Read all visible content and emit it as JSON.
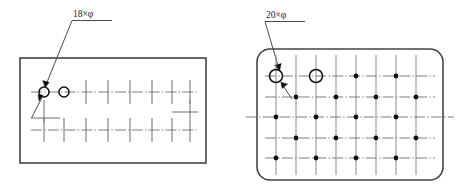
{
  "figure": {
    "background_color": "#ffffff",
    "line_color": "#6f6f6f",
    "outline_color": "#444444",
    "marker_color": "#111111"
  },
  "left_plate": {
    "name": "left-plate",
    "shape": "rectangle",
    "corner_style": "square",
    "label": {
      "text": "18×φ",
      "count": "18",
      "multiplier_symbol": "×",
      "diameter_symbol": "φ",
      "underlined": true
    },
    "outline": {
      "x": 20,
      "y": 58,
      "width": 186,
      "height": 105
    },
    "rows": [
      {
        "row": 1,
        "y": 92,
        "marker_type": "circle",
        "circle_columns": [
          1,
          2
        ],
        "tick_columns": [
          3,
          4,
          5,
          6,
          7,
          8
        ]
      },
      {
        "row": 2,
        "y": 130,
        "marker_type": "tick",
        "circle_columns": [],
        "tick_columns": [
          1,
          2,
          3,
          4,
          5,
          6,
          7,
          8
        ]
      }
    ],
    "short_row": {
      "row": 3,
      "y": 112,
      "x_start": 172,
      "x_end": 198
    },
    "circle_radius": 5.0,
    "hole_total": 18
  },
  "right_plate": {
    "name": "right-plate",
    "shape": "rounded-rectangle",
    "corner_style": "rounded",
    "corner_radius": 13,
    "label": {
      "text": "20×φ",
      "count": "20",
      "multiplier_symbol": "×",
      "diameter_symbol": "φ",
      "underlined": true
    },
    "outline": {
      "x": 257,
      "y": 49,
      "width": 186,
      "height": 131
    },
    "columns_x": [
      276,
      296,
      316,
      336,
      356,
      376,
      396,
      416
    ],
    "rows_y": [
      76,
      97,
      117,
      138,
      158
    ],
    "row_markers": [
      {
        "row": 1,
        "y": 76,
        "circles": [
          1,
          3
        ],
        "dots": [
          5,
          7
        ]
      },
      {
        "row": 2,
        "y": 97,
        "circles": [],
        "dots": [
          2,
          4,
          6,
          8
        ]
      },
      {
        "row": 3,
        "y": 117,
        "circles": [],
        "dots": [
          1,
          3,
          5,
          7
        ],
        "is_main_centerline": true
      },
      {
        "row": 4,
        "y": 138,
        "circles": [],
        "dots": [
          2,
          4,
          6,
          8
        ]
      },
      {
        "row": 5,
        "y": 158,
        "circles": [],
        "dots": [
          1,
          3,
          5,
          7
        ]
      }
    ],
    "circle_radius": 6.5,
    "dot_radius": 2.4,
    "hole_total": 20
  }
}
